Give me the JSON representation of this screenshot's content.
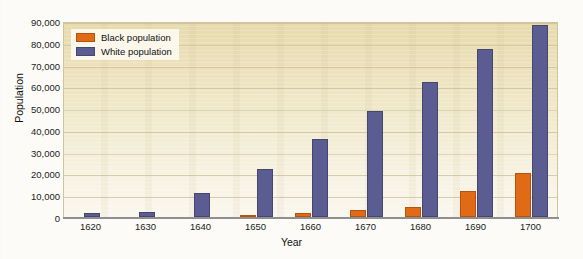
{
  "chart_data": {
    "type": "bar",
    "title": "",
    "xlabel": "Year",
    "ylabel": "Population",
    "categories": [
      "1620",
      "1630",
      "1640",
      "1650",
      "1660",
      "1670",
      "1680",
      "1690",
      "1700"
    ],
    "series": [
      {
        "name": "Black population",
        "color": "#e06a16",
        "values": [
          0,
          0,
          0,
          600,
          2000,
          3000,
          4500,
          12000,
          20000
        ]
      },
      {
        "name": "White population",
        "color": "#5b5d92",
        "values": [
          2000,
          2500,
          11000,
          22000,
          36000,
          48500,
          62000,
          77000,
          88000
        ]
      }
    ],
    "ylim": [
      0,
      90000
    ],
    "ytick_labels": [
      "0",
      "10,000",
      "20,000",
      "30,000",
      "40,000",
      "50,000",
      "60,000",
      "70,000",
      "80,000",
      "90,000"
    ],
    "ytick_values": [
      0,
      10000,
      20000,
      30000,
      40000,
      50000,
      60000,
      70000,
      80000,
      90000
    ],
    "grid": true,
    "legend_position": "top-left",
    "plot_background_top": "#e7daad",
    "plot_background_bottom": "#faf7ee",
    "gridline_color": "#cbbf93",
    "axis_color": "#8f8f8f"
  },
  "legend": {
    "items": [
      {
        "label": "Black population",
        "swatch": "black-pop"
      },
      {
        "label": "White population",
        "swatch": "white-pop"
      }
    ]
  }
}
